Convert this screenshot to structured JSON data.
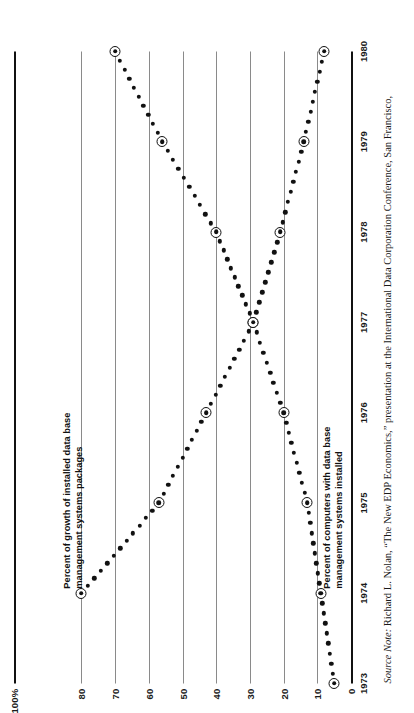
{
  "chart_data": {
    "type": "line",
    "title": "",
    "subtitle": "",
    "xlabel": "",
    "ylabel": "",
    "x": [
      1973,
      1974,
      1975,
      1976,
      1977,
      1978,
      1979,
      1980
    ],
    "xtick_labels": [
      "1973",
      "1974",
      "1975",
      "1976",
      "1977",
      "1978",
      "1979",
      "1980"
    ],
    "ytick_labels": [
      "0",
      "10",
      "20",
      "30",
      "40",
      "50",
      "60",
      "70",
      "80",
      "100%"
    ],
    "ytick_values": [
      0,
      10,
      20,
      30,
      40,
      50,
      60,
      70,
      80,
      100
    ],
    "ylim": [
      0,
      100
    ],
    "xlim": [
      1973,
      1980
    ],
    "grid": true,
    "legend_position": "inline-annotations",
    "series": [
      {
        "name": "Percent of growth of installed data base\nmanagement systems packages",
        "x": [
          1974,
          1975,
          1976,
          1977,
          1978,
          1979,
          1980
        ],
        "values": [
          80,
          57,
          43,
          29,
          21,
          14,
          8
        ],
        "style": "dotted",
        "marker": "ringed-dot",
        "color": "#111111"
      },
      {
        "name": "Percent of computers with data base\nmanagement systems installed",
        "x": [
          1973,
          1974,
          1975,
          1976,
          1977,
          1978,
          1979,
          1980
        ],
        "values": [
          5,
          9,
          13,
          20,
          29,
          40,
          56,
          70
        ],
        "style": "dotted",
        "marker": "ringed-dot",
        "color": "#111111"
      }
    ],
    "annotations": [
      {
        "name": "growth-series-label",
        "text": "Percent of growth of installed data base\nmanagement systems packages",
        "x": 1974.05,
        "y": 86
      },
      {
        "name": "installed-series-label",
        "text": "Percent of computers with data base\nmanagement systems installed",
        "x": 1974.05,
        "y": 9
      }
    ]
  },
  "source_note": {
    "prefix": "Source Note:",
    "text": " Richard L. Nolan, “The New EDP Economics,” presentation at the International Data Corporation Conference, San Francisco,"
  },
  "colors": {
    "ink": "#111111",
    "grid": "#8a8a8a",
    "background": "#ffffff"
  }
}
